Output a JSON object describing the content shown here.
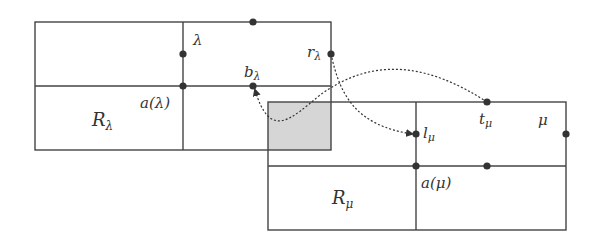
{
  "diagram": {
    "colors": {
      "line": "#444444",
      "dot": "#333333",
      "overlap_fill": "#d6d6d6",
      "background": "#ffffff"
    },
    "rect_lambda": {
      "label": "R",
      "label_sub": "λ",
      "anchor_label": "a(λ)",
      "node_label": "λ",
      "b_label": "b",
      "b_sub": "λ",
      "r_label": "r",
      "r_sub": "λ"
    },
    "rect_mu": {
      "label": "R",
      "label_sub": "μ",
      "anchor_label": "a(μ)",
      "node_label": "μ",
      "t_label": "t",
      "t_sub": "μ",
      "l_label": "l",
      "l_sub": "μ"
    },
    "arrows": [
      {
        "from": "t_μ",
        "to": "b_λ",
        "style": "dotted"
      },
      {
        "from": "r_λ",
        "to": "l_μ",
        "style": "dotted"
      }
    ]
  }
}
